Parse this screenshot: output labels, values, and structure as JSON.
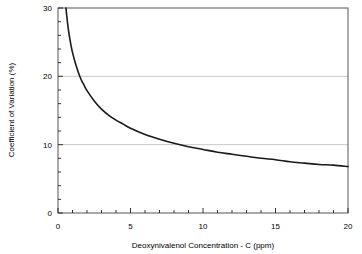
{
  "chart_data": {
    "type": "line",
    "title": "",
    "xlabel": "Deoxynivalenol Concentration - C (ppm)",
    "ylabel": "Coefficient of Variation (%)",
    "xlim": [
      0,
      20
    ],
    "ylim": [
      0,
      30
    ],
    "xticks": [
      0,
      5,
      10,
      15,
      20
    ],
    "yticks": [
      0,
      10,
      20,
      30
    ],
    "xtick_labels": [
      "0",
      "5",
      "10",
      "15",
      "20"
    ],
    "ytick_labels": [
      "0",
      "10",
      "20",
      "30"
    ],
    "x_minor_tick_interval": 1,
    "y_minor_tick_interval": 2,
    "grid": "horizontal-major-only",
    "grid_color": "#c8c8c8",
    "line_color": "#1a1a1a",
    "line_width": 1.6,
    "legend": null,
    "legend_position": "none",
    "annotations": [],
    "series": [
      {
        "name": "Coefficient of Variation",
        "x": [
          0.55,
          0.6,
          0.7,
          0.8,
          0.9,
          1.0,
          1.2,
          1.4,
          1.6,
          1.8,
          2.0,
          2.5,
          3.0,
          3.5,
          4.0,
          4.5,
          5.0,
          6.0,
          7.0,
          8.0,
          9.0,
          10.0,
          11.0,
          12.0,
          13.0,
          14.0,
          15.0,
          16.0,
          17.0,
          18.0,
          19.0,
          20.0
        ],
        "y": [
          30.0,
          28.9,
          27.1,
          25.7,
          24.5,
          23.5,
          21.9,
          20.6,
          19.5,
          18.7,
          17.9,
          16.4,
          15.2,
          14.3,
          13.6,
          13.0,
          12.4,
          11.5,
          10.8,
          10.2,
          9.7,
          9.3,
          8.9,
          8.6,
          8.3,
          8.0,
          7.8,
          7.5,
          7.3,
          7.1,
          7.0,
          6.8
        ]
      }
    ],
    "plot_area": {
      "left_px": 58,
      "right_px": 348,
      "top_px": 8,
      "bottom_px": 213
    }
  }
}
